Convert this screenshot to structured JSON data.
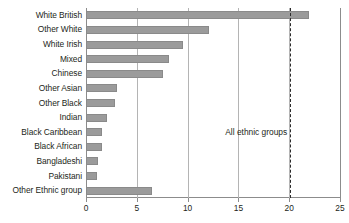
{
  "chart_data": {
    "type": "bar",
    "orientation": "horizontal",
    "title": "",
    "xlabel": "",
    "ylabel": "",
    "xlim": [
      0,
      25
    ],
    "xticks": [
      0,
      5,
      10,
      15,
      20,
      25
    ],
    "xtick_labels": [
      "0",
      "5",
      "10",
      "15",
      "20",
      "25"
    ],
    "grid": "vertical",
    "legend": "none",
    "bar_color": "#9b9b9b",
    "categories": [
      "White British",
      "Other White",
      "White Irish",
      "Mixed",
      "Chinese",
      "Other Asian",
      "Other Black",
      "Indian",
      "Black Caribbean",
      "Black African",
      "Bangladeshi",
      "Pakistani",
      "Other Ethnic group"
    ],
    "values": [
      21.9,
      12.1,
      9.5,
      8.2,
      7.6,
      3.1,
      2.9,
      2.1,
      1.6,
      1.6,
      1.2,
      1.1,
      6.5
    ],
    "annotations": [
      {
        "label": "All ethnic groups",
        "type": "reference-line",
        "value": 20.1,
        "style": "dashed",
        "color": "#2b2b2b"
      }
    ]
  }
}
